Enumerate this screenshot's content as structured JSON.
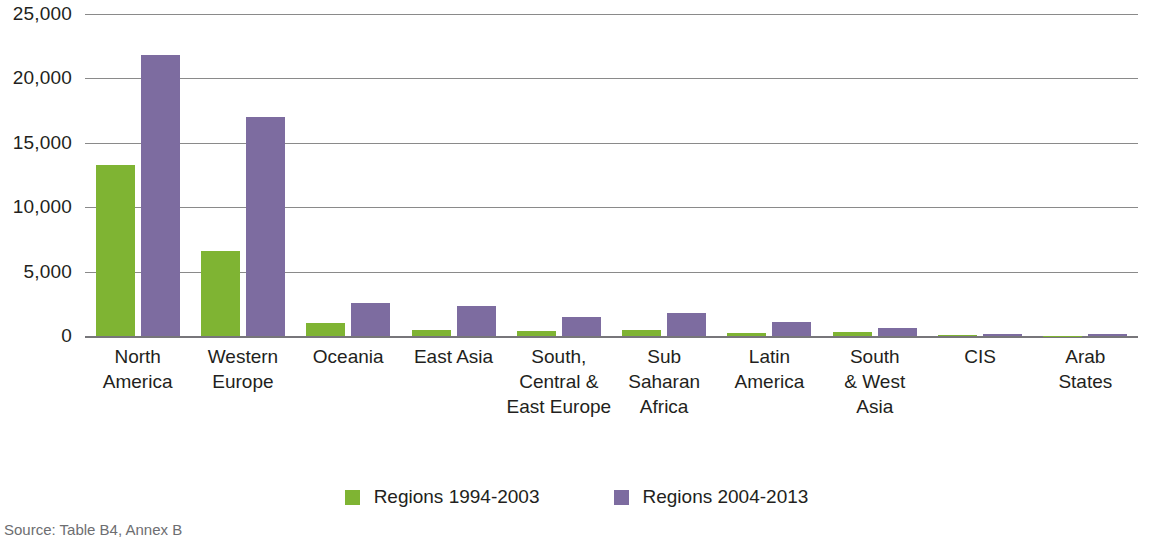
{
  "chart_data": {
    "type": "bar",
    "title": "",
    "xlabel": "",
    "ylabel": "",
    "ylim": [
      0,
      25000
    ],
    "yticks": [
      0,
      5000,
      10000,
      15000,
      20000,
      25000
    ],
    "ytick_labels": [
      "0",
      "5,000",
      "10,000",
      "15,000",
      "20,000",
      "25,000"
    ],
    "grid": true,
    "legend_position": "bottom",
    "categories": [
      "North America",
      "Western Europe",
      "Oceania",
      "East Asia",
      "South, Central & East Europe",
      "Sub Saharan Africa",
      "Latin America",
      "South & West Asia",
      "CIS",
      "Arab States"
    ],
    "category_lines": [
      [
        "North",
        "America"
      ],
      [
        "Western",
        "Europe"
      ],
      [
        "Oceania"
      ],
      [
        "East Asia"
      ],
      [
        "South,",
        "Central &",
        "East Europe"
      ],
      [
        "Sub",
        "Saharan",
        "Africa"
      ],
      [
        "Latin",
        "America"
      ],
      [
        "South",
        "& West",
        "Asia"
      ],
      [
        "CIS"
      ],
      [
        "Arab",
        "States"
      ]
    ],
    "series": [
      {
        "name": "Regions 1994-2003",
        "color": "#7fb433",
        "values": [
          13300,
          6600,
          1000,
          500,
          400,
          500,
          230,
          300,
          80,
          20
        ]
      },
      {
        "name": "Regions 2004-2013",
        "color": "#7d6ca0",
        "values": [
          21800,
          17000,
          2600,
          2300,
          1500,
          1800,
          1100,
          600,
          160,
          150
        ]
      }
    ]
  },
  "legend": {
    "items": [
      {
        "label": "Regions 1994-2003",
        "color": "#7fb433"
      },
      {
        "label": "Regions 2004-2013",
        "color": "#7d6ca0"
      }
    ]
  },
  "source": {
    "text": "Source: Table B4, Annex B"
  },
  "colors": {
    "series_a": "#7fb433",
    "series_b": "#7d6ca0",
    "gridline": "#8a8a8a",
    "axis": "#77767a",
    "text": "#231f20"
  }
}
